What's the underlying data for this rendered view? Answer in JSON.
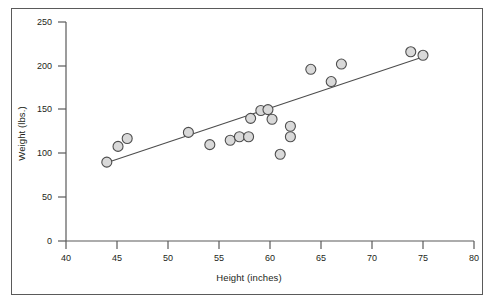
{
  "chart_data": {
    "type": "scatter",
    "title": "",
    "xlabel": "Height (inches)",
    "ylabel": "Weight (lbs.)",
    "xlim": [
      40,
      80
    ],
    "ylim": [
      0,
      250
    ],
    "xticks": [
      40,
      45,
      50,
      55,
      60,
      65,
      70,
      75,
      80
    ],
    "yticks": [
      0,
      50,
      100,
      150,
      200,
      250
    ],
    "grid": false,
    "legend": false,
    "marker": {
      "shape": "circle",
      "fill": "#d9d9d9",
      "edge": "#4d4d4d",
      "radius_px": 5
    },
    "series": [
      {
        "name": "Height vs Weight",
        "points": [
          {
            "x": 44.0,
            "y": 90
          },
          {
            "x": 45.1,
            "y": 108
          },
          {
            "x": 46.0,
            "y": 117
          },
          {
            "x": 52.0,
            "y": 124
          },
          {
            "x": 54.1,
            "y": 110
          },
          {
            "x": 56.1,
            "y": 115
          },
          {
            "x": 57.0,
            "y": 119
          },
          {
            "x": 57.9,
            "y": 119
          },
          {
            "x": 58.1,
            "y": 140
          },
          {
            "x": 59.1,
            "y": 149
          },
          {
            "x": 59.8,
            "y": 150
          },
          {
            "x": 60.2,
            "y": 139
          },
          {
            "x": 61.0,
            "y": 99
          },
          {
            "x": 62.0,
            "y": 131
          },
          {
            "x": 62.0,
            "y": 119
          },
          {
            "x": 64.0,
            "y": 196
          },
          {
            "x": 66.0,
            "y": 182
          },
          {
            "x": 67.0,
            "y": 202
          },
          {
            "x": 73.8,
            "y": 216
          },
          {
            "x": 75.0,
            "y": 212
          }
        ]
      }
    ],
    "trendline": {
      "name": "linear fit",
      "x_start": 43.9,
      "y_start": 89,
      "x_end": 75.2,
      "y_end": 211,
      "color": "#4d4d4d"
    }
  },
  "axes": {
    "x_label": "Height (inches)",
    "y_label": "Weight (lbs.)",
    "x_tick_labels": [
      "40",
      "45",
      "50",
      "55",
      "60",
      "65",
      "70",
      "75",
      "80"
    ],
    "y_tick_labels": [
      "0",
      "50",
      "100",
      "150",
      "200",
      "250"
    ]
  },
  "colors": {
    "axis": "#5a5a5a",
    "text": "#231f20",
    "marker_fill": "#d9d9d9",
    "marker_edge": "#4d4d4d",
    "trendline": "#4d4d4d",
    "frame": "#5a5a5a",
    "background": "#ffffff"
  },
  "side_caption": {
    "line1": "",
    "line2": "",
    "line3": ""
  }
}
